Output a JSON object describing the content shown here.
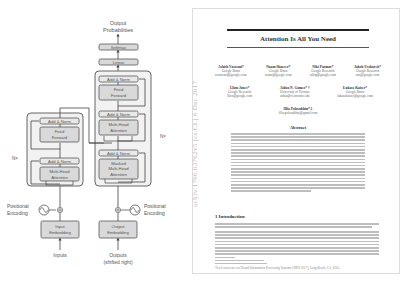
{
  "diagram": {
    "output_label_1": "Output",
    "output_label_2": "Probabilities",
    "softmax": "Softmax",
    "linear": "Linear",
    "add_norm": "Add & Norm",
    "feed_forward_1": "Feed",
    "feed_forward_2": "Forward",
    "mha_1": "Multi-Head",
    "mha_2": "Attention",
    "masked_1": "Masked",
    "masked_2": "Multi-Head",
    "masked_3": "Attention",
    "nx_left": "N×",
    "nx_right": "N×",
    "pos_enc_1": "Positional",
    "pos_enc_2": "Encoding",
    "input_emb_1": "Input",
    "input_emb_2": "Embedding",
    "output_emb_1": "Output",
    "output_emb_2": "Embedding",
    "inputs": "Inputs",
    "outputs_1": "Outputs",
    "outputs_2": "(shifted right)",
    "colors": {
      "block_bg": "#f2f2f2",
      "sublayer_bg": "#d9d9d9",
      "stroke": "#555555",
      "text": "#555555"
    }
  },
  "paper": {
    "arxiv_stamp": "arXiv:1706.03762v5 [cs.CL] 6 Dec 2017",
    "title": "Attention Is All You Need",
    "authors_row1": [
      {
        "name": "Ashish Vaswani*",
        "affil": "Google Brain",
        "email": "avaswani@google.com"
      },
      {
        "name": "Noam Shazeer*",
        "affil": "Google Brain",
        "email": "noam@google.com"
      },
      {
        "name": "Niki Parmar*",
        "affil": "Google Research",
        "email": "nikip@google.com"
      },
      {
        "name": "Jakob Uszkoreit*",
        "affil": "Google Research",
        "email": "usz@google.com"
      }
    ],
    "authors_row2": [
      {
        "name": "Llion Jones*",
        "affil": "Google Research",
        "email": "llion@google.com"
      },
      {
        "name": "Aidan N. Gomez* †",
        "affil": "University of Toronto",
        "email": "aidan@cs.toronto.edu"
      },
      {
        "name": "Łukasz Kaiser*",
        "affil": "Google Brain",
        "email": "lukaszkaiser@google.com"
      }
    ],
    "authors_row3": [
      {
        "name": "Illia Polosukhin* ‡",
        "affil": "",
        "email": "illia.polosukhin@gmail.com"
      }
    ],
    "abstract_heading": "Abstract",
    "section_heading": "1   Introduction",
    "footer": "31st Conference on Neural Information Processing Systems (NIPS 2017), Long Beach, CA, USA."
  }
}
